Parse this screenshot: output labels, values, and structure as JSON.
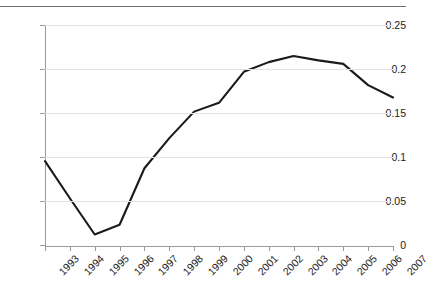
{
  "chart_data": {
    "type": "line",
    "title": "",
    "subtitle": "",
    "xlabel": "",
    "ylabel": "",
    "categories": [
      "1993",
      "1994",
      "1995",
      "1996",
      "1997",
      "1998",
      "1999",
      "2000",
      "2001",
      "2002",
      "2003",
      "2004",
      "2005",
      "2006",
      "2007"
    ],
    "series": [
      {
        "name": "series-1",
        "values": [
          0.096,
          0.054,
          0.013,
          0.024,
          0.088,
          0.122,
          0.152,
          0.162,
          0.197,
          0.208,
          0.215,
          0.21,
          0.206,
          0.182,
          0.168
        ]
      }
    ],
    "ylim": [
      0,
      0.25
    ],
    "ytick_values": [
      0,
      0.05,
      0.1,
      0.15,
      0.2,
      0.25
    ],
    "ytick_labels": [
      "0",
      "0.05",
      "0.1",
      "0.15",
      "0.2",
      "0.25"
    ],
    "grid": true,
    "grid_axis": "y",
    "legend": false,
    "legend_position": "none",
    "annotations": [],
    "colors": {
      "line": "#1a1a1a",
      "grid": "#e3e3e3",
      "axis": "#9a9a9a",
      "top_rule": "#6e6e6e",
      "text": "#1b1b1b",
      "background": "#ffffff"
    }
  },
  "figure": {
    "top_rule_present": true
  }
}
